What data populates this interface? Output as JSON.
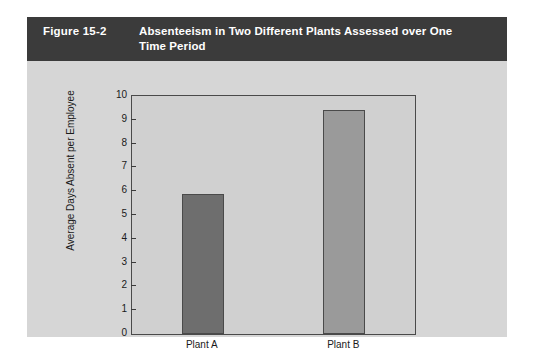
{
  "figure": {
    "number": "Figure 15-2",
    "title": "Absenteeism in Two Different Plants Assessed over One Time Period"
  },
  "colors": {
    "card_background": "#d6d6d6",
    "header_background": "#3b3b3b",
    "header_text": "#ffffff",
    "plot_background": "#d0d0d0",
    "axis": "#4a4a4a",
    "bar_plant_a": "#6e6e6e",
    "bar_plant_b": "#9a9a9a"
  },
  "chart_data": {
    "type": "bar",
    "title": "Absenteeism in Two Different Plants Assessed over One Time Period",
    "categories": [
      "Plant A",
      "Plant B"
    ],
    "values": [
      5.9,
      9.4
    ],
    "bar_colors": [
      "#6e6e6e",
      "#9a9a9a"
    ],
    "xlabel": "",
    "ylabel": "Average Days Absent per Employee",
    "ylim": [
      0,
      10
    ],
    "ytick_labels": [
      "0",
      "1",
      "2",
      "3",
      "4",
      "5",
      "6",
      "7",
      "8",
      "9",
      "10"
    ],
    "ytick_values": [
      0,
      1,
      2,
      3,
      4,
      5,
      6,
      7,
      8,
      9,
      10
    ],
    "grid": false,
    "legend": false
  }
}
